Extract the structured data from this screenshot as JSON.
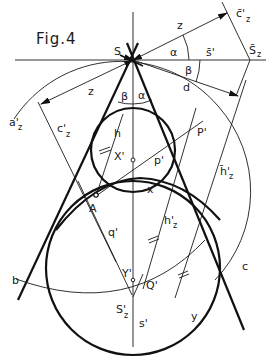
{
  "figure": {
    "title": "Fig.4",
    "background": "#ffffff",
    "line_color": "#111111"
  },
  "points": {
    "S": "S",
    "S_bar_z": "S̄",
    "S_bar_z_sub": "z",
    "c_bar_z": "c̄'",
    "c_bar_z_sub": "z",
    "X": "X'",
    "Y": "Y'",
    "A": "A",
    "P": "P'",
    "Q": "Q'",
    "S_z": "S'",
    "S_z_sub": "z",
    "s_prime": "s'"
  },
  "labels": {
    "z_top": "z",
    "z_left": "z",
    "alpha_top": "α",
    "beta_top": "β",
    "alpha_low": "α",
    "beta_low": "β",
    "s_bar": "s̄'",
    "d": "d",
    "a_z": "a'",
    "a_z_sub": "z",
    "c_z": "c'",
    "c_z_sub": "z",
    "h": "h",
    "p": "p'",
    "x": "x",
    "h_bar_z": "h̄'",
    "h_bar_z_sub": "z",
    "h_z": "h'",
    "h_z_sub": "z",
    "q": "q'",
    "b": "b",
    "c": "c",
    "y": "y"
  }
}
